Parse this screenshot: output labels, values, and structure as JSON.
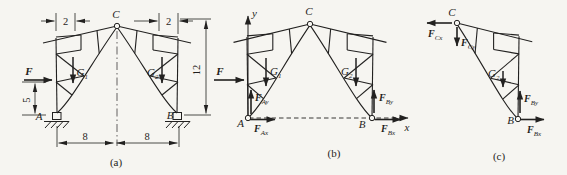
{
  "colors": {
    "background": "#f6f5f1",
    "ink": "#222120"
  },
  "panel_a": {
    "caption": "(a)",
    "apex": "C",
    "support_left": "A",
    "support_right": "B",
    "force": "F",
    "load_left": {
      "main": "G",
      "sub": "1"
    },
    "load_right": {
      "main": "G",
      "sub": "2"
    },
    "dim_top_left": "2",
    "dim_top_right": "2",
    "dim_height": "12",
    "dim_force_height": "5",
    "dim_span_left": "8",
    "dim_span_right": "8"
  },
  "panel_b": {
    "caption": "(b)",
    "apex": "C",
    "support_left": "A",
    "support_right": "B",
    "axis_x": "x",
    "axis_y": "y",
    "force": "F",
    "load_left": {
      "main": "G",
      "sub": "1"
    },
    "load_right": {
      "main": "G",
      "sub": "2"
    },
    "reaction_ax": {
      "main": "F",
      "sub": "Ax"
    },
    "reaction_ay": {
      "main": "F",
      "sub": "Ay"
    },
    "reaction_bx": {
      "main": "F",
      "sub": "Bx"
    },
    "reaction_by": {
      "main": "F",
      "sub": "By"
    }
  },
  "panel_c": {
    "caption": "(c)",
    "apex": "C",
    "support": "B",
    "load": {
      "main": "G",
      "sub": "2"
    },
    "force_cx": {
      "main": "F",
      "sub": "Cx"
    },
    "force_cy": {
      "main": "F",
      "sub": "Cy"
    },
    "reaction_bx": {
      "main": "F",
      "sub": "Bx"
    },
    "reaction_by": {
      "main": "F",
      "sub": "By"
    }
  }
}
